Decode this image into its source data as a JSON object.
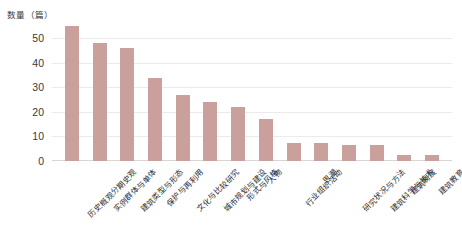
{
  "chart_data": {
    "type": "bar",
    "title": "",
    "subtitle": "",
    "xlabel": "",
    "ylabel": "数量（篇）",
    "ylim": [
      0,
      55
    ],
    "yticks": [
      0,
      10,
      20,
      30,
      40,
      50
    ],
    "ytick_labels": [
      "0",
      "10",
      "20",
      "30",
      "40",
      "50"
    ],
    "grid": true,
    "legend": false,
    "legend_position": "none",
    "bar_color": "#c9a09b",
    "categories": [
      "历史概观分期史观",
      "实例群体与单体",
      "建筑类型与形态",
      "保护与再利用",
      "文化与比较研究",
      "城市规划与建设",
      "形式与风格",
      "人物",
      "行业组织活动",
      "思潮",
      "研究状况与方法",
      "建筑科学与技术",
      "建筑制度",
      "建筑教育"
    ],
    "values": [
      55,
      48,
      46,
      34,
      27,
      24,
      22,
      17,
      7.5,
      7.5,
      6.5,
      6.5,
      2.5,
      2.5
    ],
    "series": [
      {
        "name": "数量（篇）",
        "values": [
          55,
          48,
          46,
          34,
          27,
          24,
          22,
          17,
          7.5,
          7.5,
          6.5,
          6.5,
          2.5,
          2.5
        ]
      }
    ]
  },
  "axis": {
    "y_title": "数量（篇）",
    "tick_labels": [
      "0",
      "10",
      "20",
      "30",
      "40",
      "50"
    ]
  },
  "colors": {
    "bar": "#c9a09b",
    "gridline": "#eceaea",
    "baseline": "#d8d5d5",
    "text": "#2e2e2e",
    "background": "#ffffff"
  }
}
